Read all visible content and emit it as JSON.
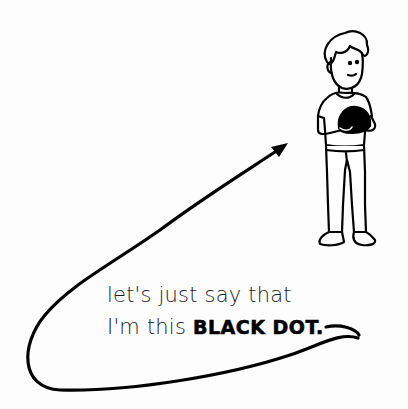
{
  "caption": {
    "line1": "let's just say that",
    "line2_prefix": "I'm this ",
    "line2_emphasis": "BLACK DOT."
  },
  "figure": {
    "ink_color": "#000000",
    "background_color": "#fdfdfd"
  }
}
